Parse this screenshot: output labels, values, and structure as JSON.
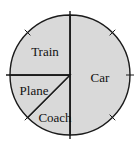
{
  "chart_data": {
    "type": "pie",
    "title": "",
    "start": "top",
    "direction": "clockwise",
    "slices": [
      {
        "label": "Car",
        "value": 50,
        "unit": "percent"
      },
      {
        "label": "Coach",
        "value": 12.5,
        "unit": "percent"
      },
      {
        "label": "Plane",
        "value": 12.5,
        "unit": "percent"
      },
      {
        "label": "Train",
        "value": 25,
        "unit": "percent"
      }
    ],
    "tick_marks_degrees": [
      45,
      90,
      135,
      225,
      315
    ],
    "legend": "none",
    "colors": {
      "fill": "#d9d9d9",
      "stroke": "#1a1a1a",
      "background": "#ffffff"
    }
  }
}
